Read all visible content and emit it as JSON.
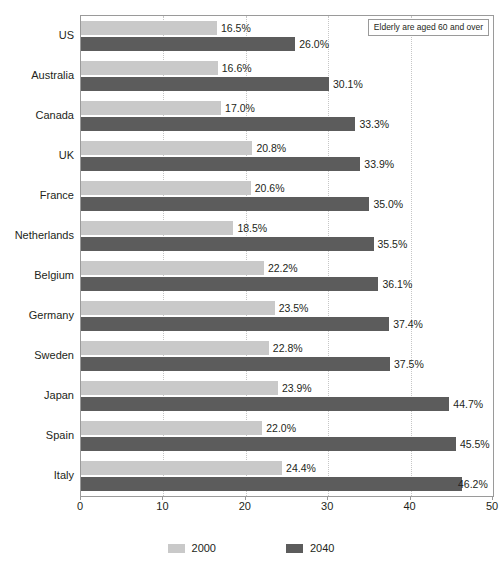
{
  "chart_data": {
    "type": "bar",
    "orientation": "horizontal",
    "title": "",
    "xlabel": "",
    "ylabel": "",
    "xlim": [
      0,
      50
    ],
    "xticks": [
      0,
      10,
      20,
      30,
      40,
      50
    ],
    "xtick_labels": [
      "0",
      "10",
      "20",
      "30",
      "40",
      "50"
    ],
    "grid": true,
    "grid_axis": "x",
    "legend_position": "bottom",
    "value_label_suffix": "%",
    "categories": [
      "US",
      "Australia",
      "Canada",
      "UK",
      "France",
      "Netherlands",
      "Belgium",
      "Germany",
      "Sweden",
      "Japan",
      "Spain",
      "Italy"
    ],
    "series": [
      {
        "name": "2000",
        "color": "#c9c9c9",
        "values": [
          16.5,
          16.6,
          17.0,
          20.8,
          20.6,
          18.5,
          22.2,
          23.5,
          22.8,
          23.9,
          22.0,
          24.4
        ],
        "labels": [
          "16.5%",
          "16.6%",
          "17.0%",
          "20.8%",
          "20.6%",
          "18.5%",
          "22.2%",
          "23.5%",
          "22.8%",
          "23.9%",
          "22.0%",
          "24.4%"
        ]
      },
      {
        "name": "2040",
        "color": "#5c5c5c",
        "values": [
          26.0,
          30.1,
          33.3,
          33.9,
          35.0,
          35.5,
          36.1,
          37.4,
          37.5,
          44.7,
          45.5,
          46.2
        ],
        "labels": [
          "26.0%",
          "30.1%",
          "33.3%",
          "33.9%",
          "35.0%",
          "35.5%",
          "36.1%",
          "37.4%",
          "37.5%",
          "44.7%",
          "45.5%",
          "46.2%"
        ]
      }
    ],
    "annotations": [
      {
        "text": "Elderly are aged 60 and over",
        "position": "top-right"
      }
    ]
  },
  "legend": {
    "items": [
      {
        "label": "2000"
      },
      {
        "label": "2040"
      }
    ]
  },
  "note": {
    "text": "Elderly are aged 60 and over"
  }
}
